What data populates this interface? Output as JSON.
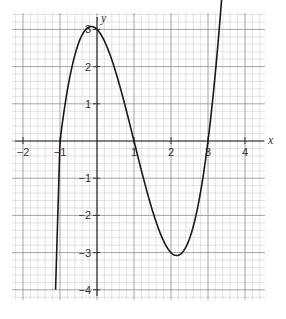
{
  "chart_data": {
    "type": "line",
    "title": "",
    "xlabel": "x",
    "ylabel": "y",
    "xlim": [
      -2.3,
      4.5
    ],
    "ylim": [
      -4.4,
      3.4
    ],
    "grid": true,
    "grid_minor_step": 0.2,
    "x_ticks": [
      -2,
      -1,
      1,
      2,
      3,
      4
    ],
    "x_tick_labels": [
      "-2",
      "-1",
      "1",
      "2",
      "3",
      "4"
    ],
    "y_ticks": [
      3,
      2,
      1,
      -1,
      -2,
      -3,
      -4
    ],
    "y_tick_labels": [
      "3",
      "2",
      "1",
      "-1",
      "-2",
      "-3",
      "-4"
    ],
    "series": [
      {
        "name": "y = x^3 - 3x^2 - x + 3",
        "x": [
          -1.12,
          -1.0,
          -0.8,
          -0.6,
          -0.4,
          -0.2,
          0.0,
          0.2,
          0.4,
          0.6,
          0.8,
          1.0,
          1.2,
          1.4,
          1.6,
          1.8,
          2.0,
          2.2,
          2.4,
          2.6,
          2.8,
          3.0,
          3.2,
          3.4,
          3.52
        ],
        "values": [
          -0.93,
          0.0,
          1.57,
          2.62,
          3.18,
          3.08,
          3.0,
          2.69,
          2.18,
          1.54,
          0.83,
          0.0,
          -0.8,
          -1.54,
          -2.18,
          -2.69,
          -3.0,
          -3.08,
          -2.88,
          -2.35,
          -1.44,
          0.0,
          1.79,
          4.18,
          5.0
        ]
      }
    ],
    "key_points": {
      "roots": [
        -1,
        1,
        3
      ],
      "local_max": [
        0,
        3
      ],
      "local_min": [
        2,
        -3
      ],
      "start": [
        -1.12,
        -4
      ],
      "end": [
        3.5,
        3.2
      ]
    },
    "colors": {
      "curve": "#1a1a1a",
      "axis": "#333333",
      "grid_minor": "#cfcfcf",
      "grid_major": "#9a9a9a",
      "background": "#ffffff"
    }
  }
}
